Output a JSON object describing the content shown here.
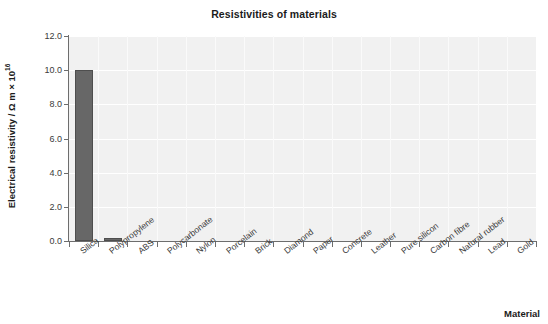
{
  "chart_data": {
    "type": "bar",
    "title": "Resistivities of materials",
    "xlabel": "Material",
    "ylabel": "Electrical resistivity / Ω m × 10",
    "ylabel_exponent": "16",
    "categories": [
      "Silica",
      "Polypropylene",
      "ABS",
      "Polycarbonate",
      "Nylon",
      "Porcelain",
      "Brick",
      "Diamond",
      "Paper",
      "Concrete",
      "Leather",
      "Pure silicon",
      "Carbon fibre",
      "Natural rubber",
      "Lead",
      "Gold"
    ],
    "values": [
      10.0,
      0.2,
      0.0,
      0.0,
      0.0,
      0.0,
      0.0,
      0.0,
      0.0,
      0.0,
      0.0,
      0.0,
      0.0,
      0.0,
      0.0,
      0.0
    ],
    "ylim": [
      0.0,
      12.0
    ],
    "yticks": [
      "12.0",
      "10.0",
      "8.0",
      "6.0",
      "4.0",
      "2.0",
      "0.0"
    ],
    "ytick_values": [
      12.0,
      10.0,
      8.0,
      6.0,
      4.0,
      2.0,
      0.0
    ],
    "grid": true,
    "legend": false,
    "bar_color": "#676767",
    "plot_background": "#f1f1f1",
    "gridline_color": "#ffffff"
  }
}
